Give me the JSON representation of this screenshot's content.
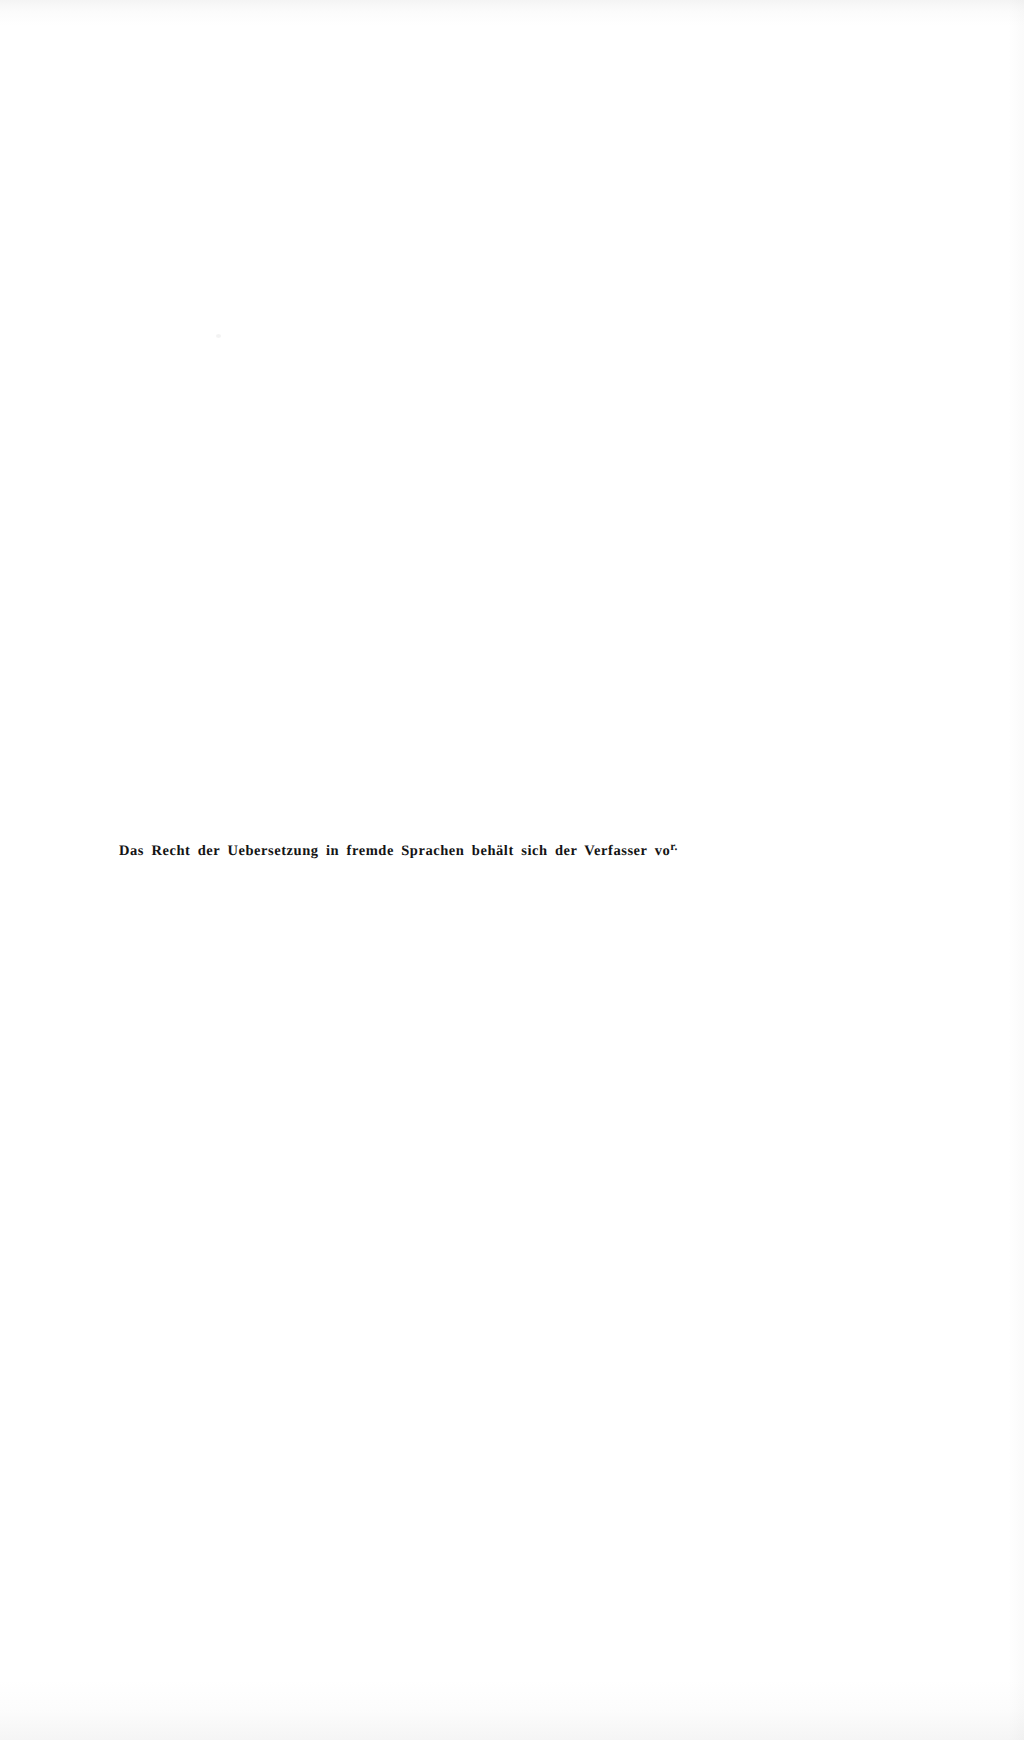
{
  "page": {
    "kind": "scanned-book-page",
    "background_color": "#ffffff",
    "ink_color": "#141414",
    "width_px": 1024,
    "height_px": 1740
  },
  "notice": {
    "full_text": "Das Recht der Uebersetzung in fremde Sprachen behält sich der Verfasser vor.",
    "body": "Das Recht der Uebersetzung in fremde Sprachen behält sich der Verfasser vo",
    "raised_suffix": "r.",
    "language": "de"
  },
  "artifacts": {
    "speck_label": "",
    "edge_shading_label": ""
  }
}
